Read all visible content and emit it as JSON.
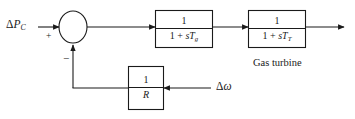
{
  "diagram": {
    "type": "control-block-diagram",
    "colors": {
      "line": "#1a1a1a",
      "text": "#1a1a1a",
      "background": "#ffffff"
    },
    "input": {
      "label_delta": "Δ",
      "label_symbol": "P",
      "label_subscript": "C",
      "full_label": "ΔP_C"
    },
    "summing_junction": {
      "name": "summing-junction",
      "plus_sign": "+",
      "minus_sign": "−",
      "plus_input": "ΔP_C",
      "minus_input": "feedback"
    },
    "blocks": [
      {
        "id": "governor",
        "numerator": "1",
        "denominator_prefix": "1 + ",
        "denominator_s": "s",
        "denominator_T": "T",
        "denominator_subscript": "g",
        "transfer_function": "1/(1 + sT_g)",
        "caption": ""
      },
      {
        "id": "turbine",
        "numerator": "1",
        "denominator_prefix": "1 + ",
        "denominator_s": "s",
        "denominator_T": "T",
        "denominator_subscript": "T",
        "transfer_function": "1/(1 + sT_T)",
        "caption": "Gas turbine"
      },
      {
        "id": "droop",
        "numerator": "1",
        "denominator_T": "R",
        "transfer_function": "1/R",
        "caption": ""
      }
    ],
    "feedback_input": {
      "label_delta": "Δ",
      "label_symbol": "ω",
      "full_label": "Δω"
    },
    "output": {
      "label": ""
    }
  }
}
